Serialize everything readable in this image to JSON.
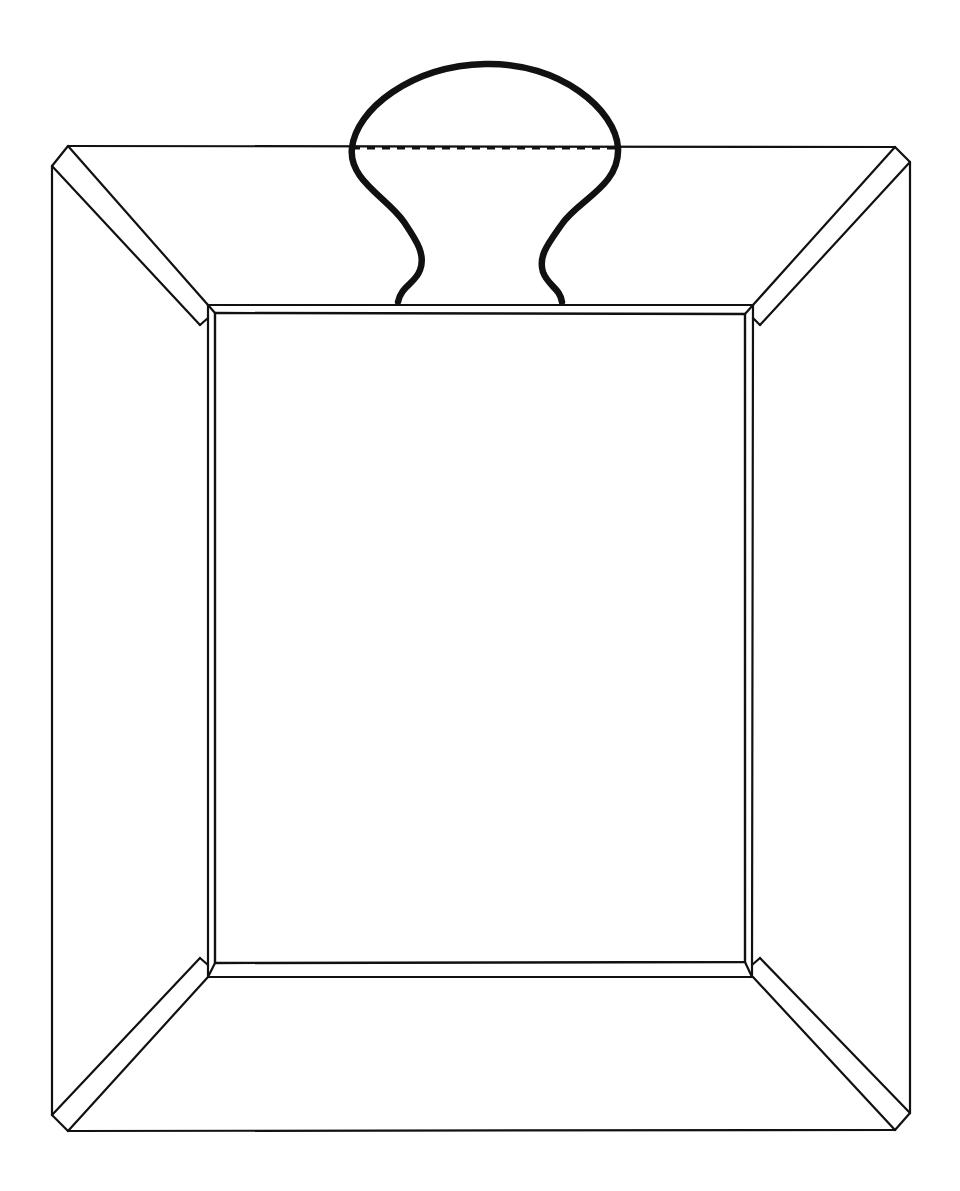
{
  "document": {
    "title": "Line Drawing",
    "background_color": "#ffffff",
    "stroke_color": "#111111",
    "canvas_width": 960,
    "canvas_height": 1191,
    "description": "Black-and-white technical line drawing of a rectangular tray or picture frame shown in perspective, with a bulbous knob-shaped handle rising from the top edge and a dashed construction line across the handle."
  },
  "drawing": {
    "type": "line-art",
    "fill": "none",
    "shapes": [
      {
        "name": "outer-frame-quadrilateral",
        "role": "outermost rim outline of the tray",
        "stroke_width": 2.2,
        "points": [
          [
            68,
            146
          ],
          [
            895,
            147
          ],
          [
            910,
            162
          ],
          [
            910,
            1113
          ],
          [
            895,
            1130
          ],
          [
            68,
            1131
          ],
          [
            52,
            1115
          ],
          [
            52,
            166
          ]
        ]
      },
      {
        "name": "outer-frame-top-edge",
        "role": "top rim line running between the top corners",
        "stroke_width": 2.2,
        "points": [
          [
            68,
            146
          ],
          [
            895,
            147
          ]
        ]
      },
      {
        "name": "outer-frame-left-edge",
        "role": "left outer vertical edge",
        "stroke_width": 2.2,
        "points": [
          [
            52,
            166
          ],
          [
            52,
            1115
          ]
        ]
      },
      {
        "name": "outer-frame-right-edge",
        "role": "right outer vertical edge",
        "stroke_width": 2.2,
        "points": [
          [
            910,
            162
          ],
          [
            910,
            1113
          ]
        ]
      },
      {
        "name": "outer-frame-bottom-edge",
        "role": "bottom outer edge line",
        "stroke_width": 2.2,
        "points": [
          [
            68,
            1131
          ],
          [
            895,
            1130
          ]
        ]
      },
      {
        "name": "bevel-diagonal-top-left-outer",
        "role": "perspective miter from outer top-left corner to inner panel corner",
        "stroke_width": 2.2,
        "points": [
          [
            68,
            146
          ],
          [
            208,
            305
          ]
        ]
      },
      {
        "name": "bevel-diagonal-top-left-inner",
        "role": "second miter line parallel to the top-left bevel",
        "stroke_width": 2.2,
        "points": [
          [
            52,
            166
          ],
          [
            200,
            325
          ]
        ]
      },
      {
        "name": "bevel-diagonal-top-right-outer",
        "role": "perspective miter from outer top-right corner to inner panel corner",
        "stroke_width": 2.2,
        "points": [
          [
            895,
            147
          ],
          [
            753,
            305
          ]
        ]
      },
      {
        "name": "bevel-diagonal-top-right-inner",
        "role": "second miter line parallel to the top-right bevel",
        "stroke_width": 2.2,
        "points": [
          [
            910,
            162
          ],
          [
            760,
            325
          ]
        ]
      },
      {
        "name": "bevel-diagonal-bottom-left-outer",
        "role": "perspective miter from outer bottom-left corner to inner panel corner",
        "stroke_width": 2.2,
        "points": [
          [
            68,
            1131
          ],
          [
            208,
            977
          ]
        ]
      },
      {
        "name": "bevel-diagonal-bottom-left-inner",
        "role": "second miter line parallel to the bottom-left bevel",
        "stroke_width": 2.2,
        "points": [
          [
            52,
            1115
          ],
          [
            200,
            958
          ]
        ]
      },
      {
        "name": "bevel-diagonal-bottom-right-outer",
        "role": "perspective miter from outer bottom-right corner to inner panel corner",
        "stroke_width": 2.2,
        "points": [
          [
            895,
            1130
          ],
          [
            753,
            977
          ]
        ]
      },
      {
        "name": "bevel-diagonal-bottom-right-inner",
        "role": "second miter line parallel to the bottom-right bevel",
        "stroke_width": 2.2,
        "points": [
          [
            910,
            1113
          ],
          [
            760,
            958
          ]
        ]
      },
      {
        "name": "inner-opening-outer-rectangle",
        "role": "outer boundary of the recessed inner panel",
        "stroke_width": 2.2,
        "points": [
          [
            208,
            305
          ],
          [
            753,
            305
          ],
          [
            752,
            977
          ],
          [
            208,
            977
          ]
        ],
        "closed": true
      },
      {
        "name": "inner-opening-inner-rectangle",
        "role": "inner boundary of the recessed inner panel, offset inward",
        "stroke_width": 2.4,
        "points": [
          [
            215,
            313
          ],
          [
            745,
            314
          ],
          [
            745,
            962
          ],
          [
            215,
            963
          ]
        ],
        "closed": true
      },
      {
        "name": "handle-knob-outline",
        "role": "bulbous knob handle rising above the top edge with S-curved legs",
        "stroke_width": 6.5,
        "path": "M 398 302 C 401 286 415 284 420 270 C 426 254 416 240 404 222 C 388 198 348 180 352 148 C 356 110 410 66 485 64 C 560 62 616 110 618 148 C 620 186 578 200 562 224 C 548 244 538 256 543 272 C 548 286 560 288 562 302"
      },
      {
        "name": "handle-dashed-construction-line",
        "role": "horizontal dashed line across the widest part of the knob handle",
        "stroke_width": 3,
        "dash_pattern": [
          8,
          7
        ],
        "points": [
          [
            352,
            148
          ],
          [
            618,
            148
          ]
        ]
      }
    ]
  }
}
